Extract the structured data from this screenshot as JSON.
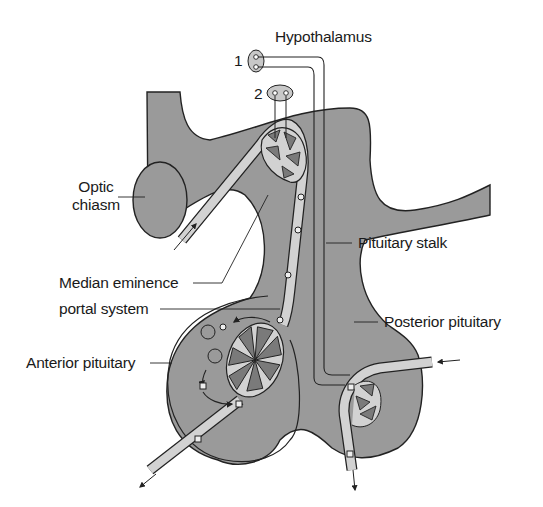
{
  "diagram": {
    "labels": {
      "hypothalamus": "Hypothalamus",
      "nucleus_1": "1",
      "nucleus_2": "2",
      "optic_chiasm_line1": "Optic",
      "optic_chiasm_line2": "chiasm",
      "pituitary_stalk": "Pituitary stalk",
      "median_eminence": "Median eminence",
      "portal_system": "portal system",
      "posterior_pituitary": "Posterior pituitary",
      "anterior_pituitary": "Anterior pituitary"
    },
    "colors": {
      "tissue": "#9a9a9a",
      "vessel": "#d2d2d2",
      "capillary_fill": "#7a7a7a",
      "nucleus": "#c8c8c8",
      "outline": "#222222",
      "text": "#1a1a1a"
    }
  }
}
